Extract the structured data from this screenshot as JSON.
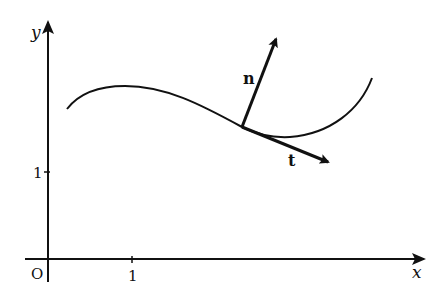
{
  "diagram": {
    "axes": {
      "x_label": "x",
      "y_label": "y",
      "origin_label": "O",
      "x_tick_label": "1",
      "y_tick_label": "1"
    },
    "vectors": {
      "normal_label": "n",
      "tangent_label": "t"
    },
    "colors": {
      "ink": "#111111",
      "background": "#ffffff"
    }
  }
}
